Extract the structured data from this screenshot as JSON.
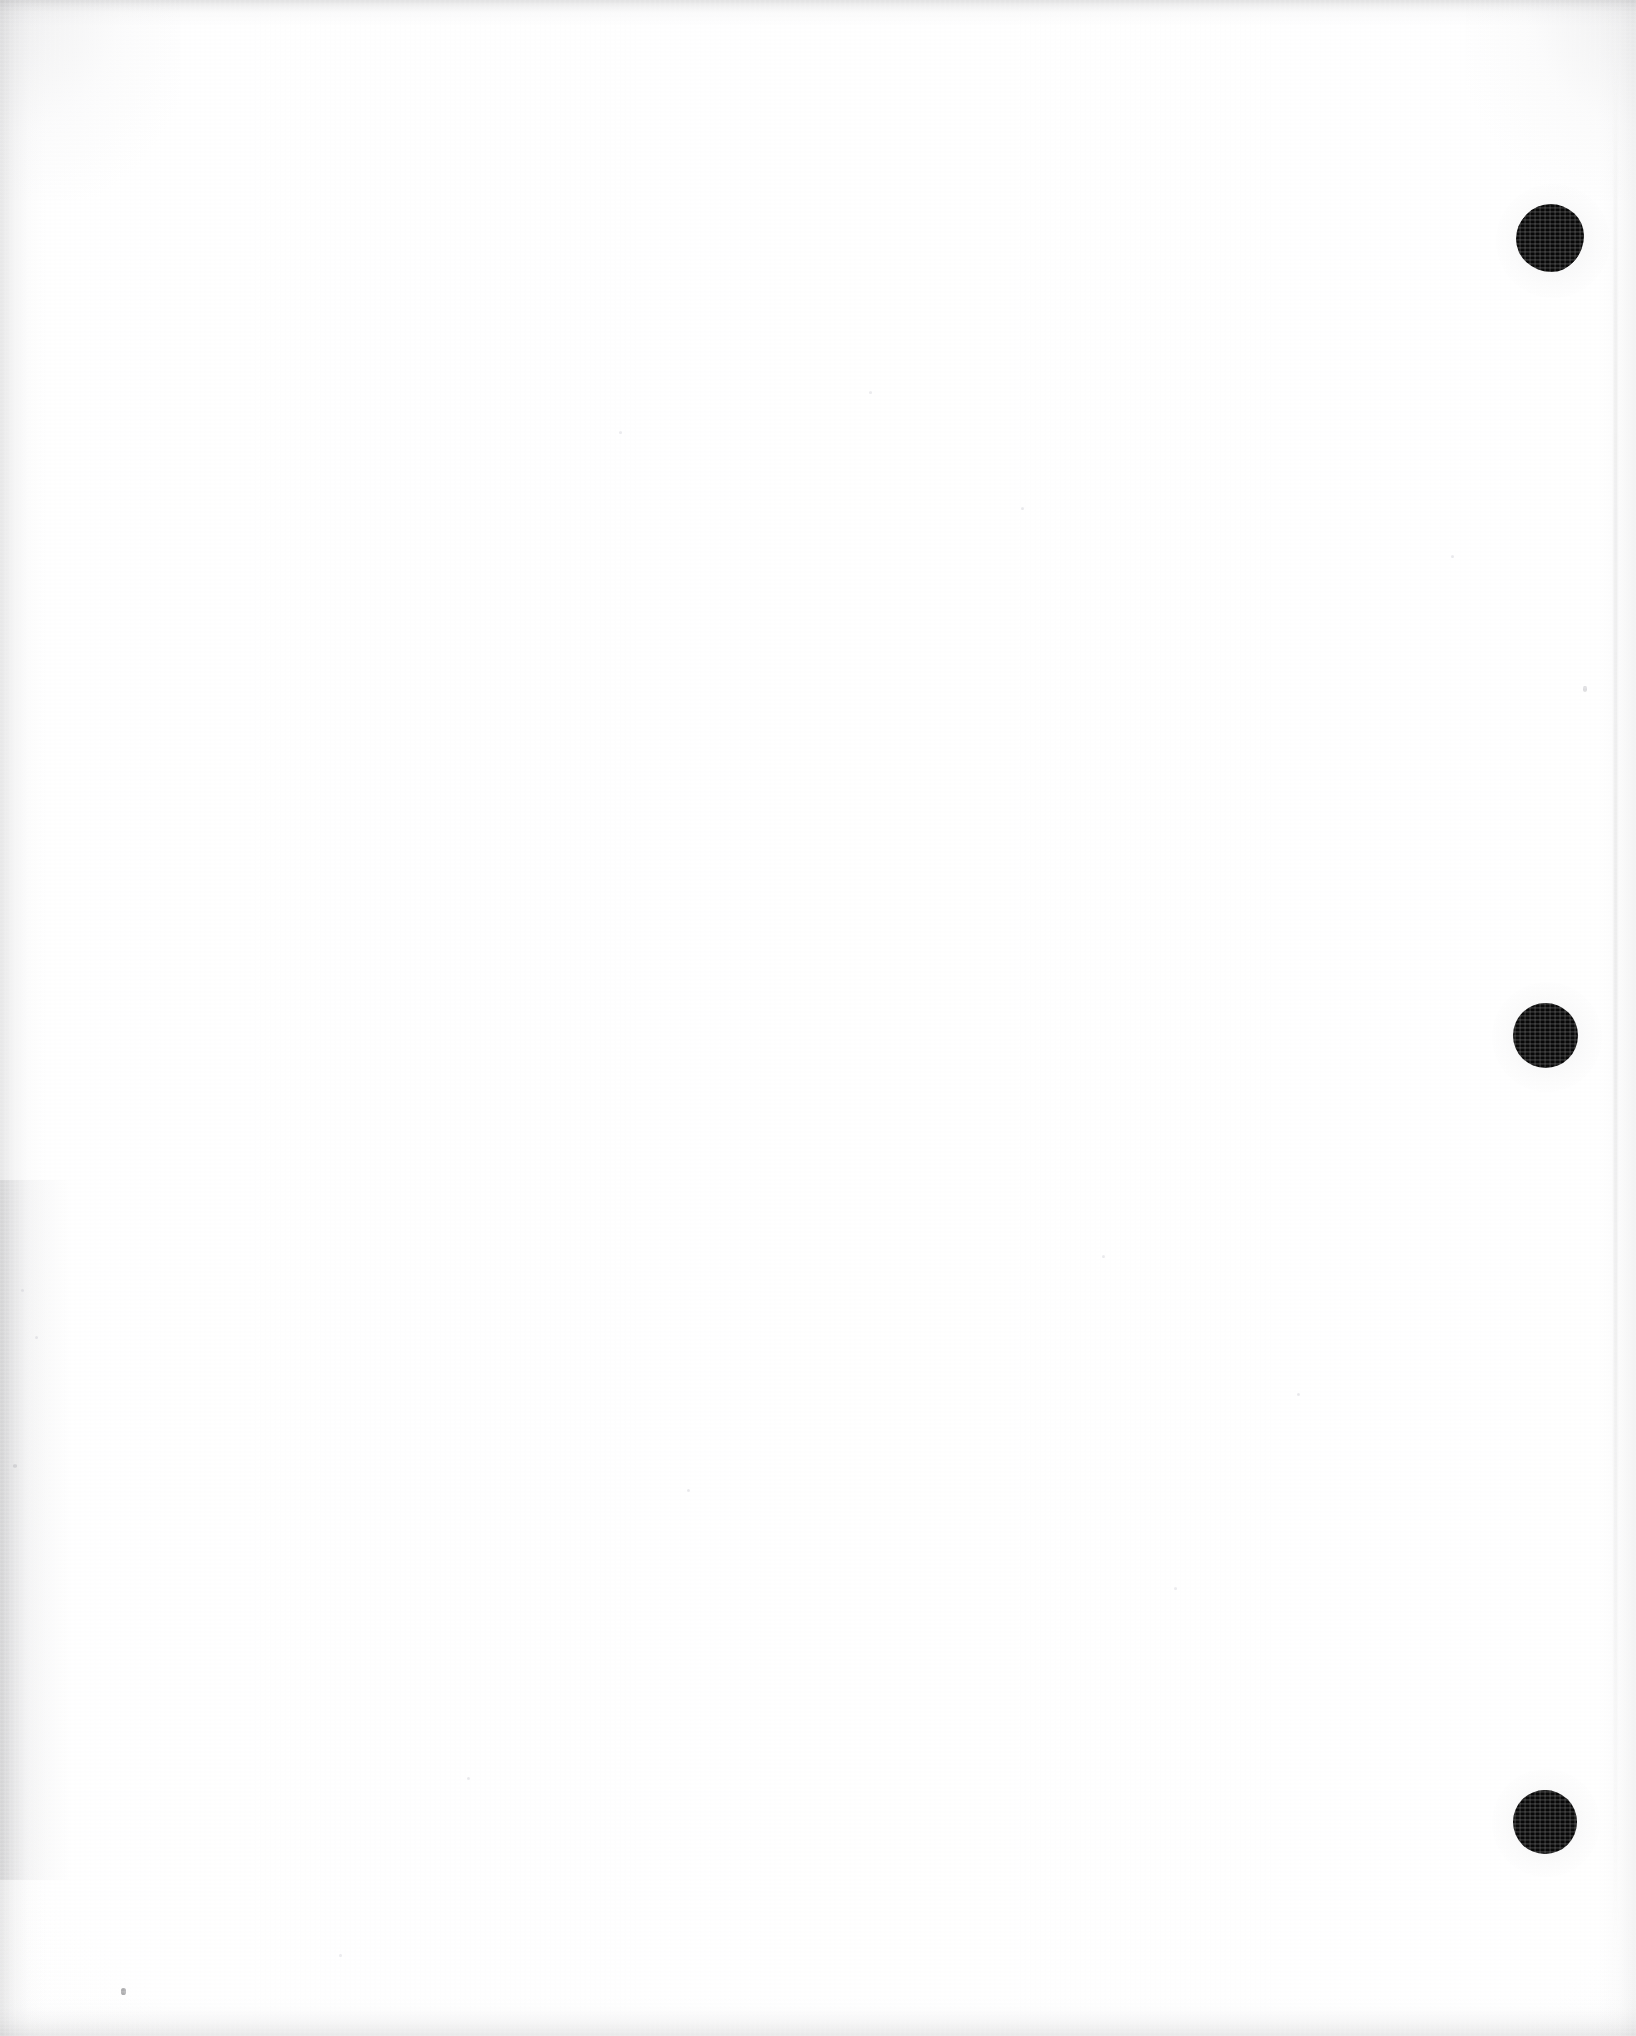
{
  "document": {
    "kind": "scanned-blank-page",
    "page_content_text": "",
    "visible_text": "",
    "background_color": "#ffffff",
    "ink_color": "#080808",
    "width_px": 1636,
    "height_px": 2036
  },
  "marks": {
    "punch_dots": [
      {
        "name": "punch-dot-top",
        "shape": "filled-circle",
        "style": "blotted",
        "color": "#080808",
        "center_x": 1550,
        "center_y": 238,
        "diameter": 66
      },
      {
        "name": "punch-dot-middle",
        "shape": "filled-circle",
        "style": "clean",
        "color": "#080808",
        "center_x": 1545,
        "center_y": 1035,
        "diameter": 65
      },
      {
        "name": "punch-dot-bottom",
        "shape": "filled-circle",
        "style": "clean",
        "color": "#080808",
        "center_x": 1545,
        "center_y": 1822,
        "diameter": 64
      }
    ],
    "specks": [
      {
        "x": 123,
        "y": 1990,
        "size": 5,
        "tone": "dark"
      },
      {
        "x": 1585,
        "y": 688,
        "size": 4,
        "tone": "faint"
      },
      {
        "x": 620,
        "y": 432,
        "size": 3,
        "tone": "vfaint"
      },
      {
        "x": 1022,
        "y": 508,
        "size": 3,
        "tone": "vfaint"
      },
      {
        "x": 1103,
        "y": 1256,
        "size": 3,
        "tone": "vfaint"
      },
      {
        "x": 1298,
        "y": 1394,
        "size": 3,
        "tone": "vfaint"
      },
      {
        "x": 1175,
        "y": 1588,
        "size": 3,
        "tone": "vfaint"
      },
      {
        "x": 468,
        "y": 1778,
        "size": 3,
        "tone": "vfaint"
      },
      {
        "x": 14,
        "y": 1465,
        "size": 4,
        "tone": "faint"
      },
      {
        "x": 36,
        "y": 1337,
        "size": 3,
        "tone": "vfaint"
      },
      {
        "x": 22,
        "y": 1290,
        "size": 3,
        "tone": "vfaint"
      },
      {
        "x": 340,
        "y": 1955,
        "size": 3,
        "tone": "vfaint"
      },
      {
        "x": 688,
        "y": 1490,
        "size": 3,
        "tone": "vfaint"
      },
      {
        "x": 870,
        "y": 392,
        "size": 3,
        "tone": "vfaint"
      },
      {
        "x": 1452,
        "y": 556,
        "size": 3,
        "tone": "vfaint"
      }
    ]
  },
  "edges": {
    "top_shadow": "#96969a",
    "left_shadow": "#9e9ea0",
    "bottom_shadow": "#a6a6a8",
    "right_crease": "#bcbcbe"
  }
}
